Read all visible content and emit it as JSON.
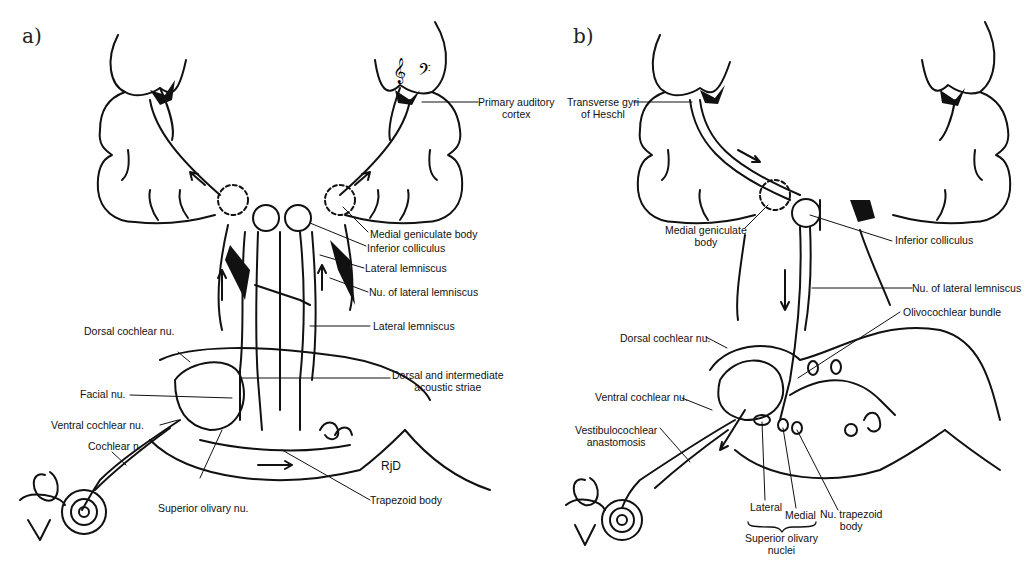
{
  "panels": [
    {
      "letter": "a)",
      "labels": {
        "primary_auditory_cortex": "Primary auditory\ncortex",
        "primary_auditory_cortex_l1": "Primary auditory",
        "primary_auditory_cortex_l2": "cortex",
        "medial_geniculate_body": "Medial geniculate body",
        "inferior_colliculus": "Inferior colliculus",
        "lateral_lemniscus_upper": "Lateral lemniscus",
        "nu_lateral_lemniscus": "Nu. of lateral lemniscus",
        "lateral_lemniscus_lower": "Lateral lemniscus",
        "dorsal_cochlear_nu": "Dorsal cochlear nu.",
        "dorsal_intermediate_striae_l1": "Dorsal and intermediate",
        "dorsal_intermediate_striae_l2": "acoustic striae",
        "facial_nu": "Facial nu.",
        "ventral_cochlear_nu": "Ventral cochlear nu.",
        "cochlear_n": "Cochlear n.",
        "superior_olivary_nu": "Superior olivary nu.",
        "trapezoid_body": "Trapezoid body",
        "signature": "RjD"
      },
      "symbols": [
        "treble-clef",
        "bass-clef"
      ]
    },
    {
      "letter": "b)",
      "labels": {
        "transverse_gyri_l1": "Transverse gyri",
        "transverse_gyri_l2": "of Heschl",
        "medial_geniculate_l1": "Medial geniculate",
        "medial_geniculate_l2": "body",
        "inferior_colliculus": "Inferior colliculus",
        "nu_lateral_lemniscus": "Nu. of lateral lemniscus",
        "olivocochlear_bundle": "Olivocochlear bundle",
        "dorsal_cochlear_nu": "Dorsal cochlear nu.",
        "ventral_cochlear_nu": "Ventral cochlear nu.",
        "vestibulocochlear_l1": "Vestibulocochlear",
        "vestibulocochlear_l2": "anastomosis",
        "lateral": "Lateral",
        "medial": "Medial",
        "nu_trapezoid_l1": "Nu. trapezoid",
        "nu_trapezoid_l2": "body",
        "superior_olivary_l1": "Superior olivary",
        "superior_olivary_l2": "nuclei"
      }
    }
  ],
  "colors": {
    "ink": "#111111",
    "background": "#ffffff"
  }
}
